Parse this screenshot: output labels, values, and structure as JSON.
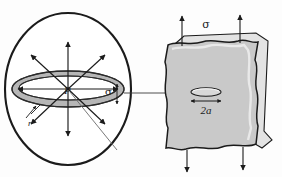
{
  "figure": {
    "background_color": "#fdfdfd",
    "stroke_color": "#1b1b1b",
    "ring_fill": "#b6b6b6",
    "block_fill": "#c9c9c9",
    "block_side_fill": "#e3e3e3",
    "crack_fill": "#d8d8d8"
  },
  "left_panel": {
    "name": "sphere-with-penny-crack",
    "center_label": "P",
    "ring_stress_label": "σ",
    "radius_label": "r",
    "sphere": {
      "cx": 68,
      "cy": 89,
      "rx": 63,
      "ry": 76
    },
    "ring": {
      "cx": 68,
      "cy": 89,
      "rx": 56,
      "ry": 18,
      "thickness": 7
    },
    "arrows": [
      {
        "name": "arrow-up",
        "angle_deg": 90,
        "length": 46
      },
      {
        "name": "arrow-up-right",
        "angle_deg": 45,
        "length": 46
      },
      {
        "name": "arrow-right",
        "angle_deg": 0,
        "length": 48
      },
      {
        "name": "arrow-down-right",
        "angle_deg": -45,
        "length": 46
      },
      {
        "name": "arrow-down",
        "angle_deg": -90,
        "length": 46
      },
      {
        "name": "arrow-down-left",
        "angle_deg": -135,
        "length": 46
      },
      {
        "name": "arrow-left",
        "angle_deg": 180,
        "length": 48
      },
      {
        "name": "arrow-up-left",
        "angle_deg": 135,
        "length": 46
      }
    ]
  },
  "connector": {
    "name": "magnifier-connector-line",
    "from_x": 124,
    "to_x": 206,
    "y": 93
  },
  "right_panel": {
    "name": "stressed-block-with-crack",
    "top_stress_label": "σ",
    "crack_width_label": "2a",
    "load_arrows_top": 2,
    "load_arrows_bottom": 2,
    "crack": {
      "cx": 206,
      "cy": 93,
      "rx": 15,
      "ry": 4
    }
  }
}
